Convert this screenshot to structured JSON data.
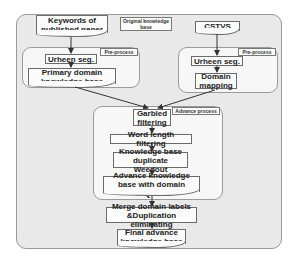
{
  "diagram": {
    "title_tag": "Original knowledge base",
    "left_source": "Keywords of published paper",
    "right_source": "CSTVS",
    "left_group": {
      "tag": "Pre-process",
      "steps": [
        "Urheen seg.",
        "Primary domain knowledge base"
      ]
    },
    "right_group": {
      "tag": "Pre-process",
      "steps": [
        "Urheen seg.",
        "Domain mapping"
      ]
    },
    "advance_group": {
      "tag": "Advance process",
      "steps": [
        "Garbled filtering",
        "Word length filtering",
        "Knowledge base duplicate Weedout",
        "Advance knowledge base with domain F/Q/T/U"
      ]
    },
    "merge_step": "Merge domain labels &Duplication eliminating",
    "final_step": "Final advance knowledge base"
  }
}
